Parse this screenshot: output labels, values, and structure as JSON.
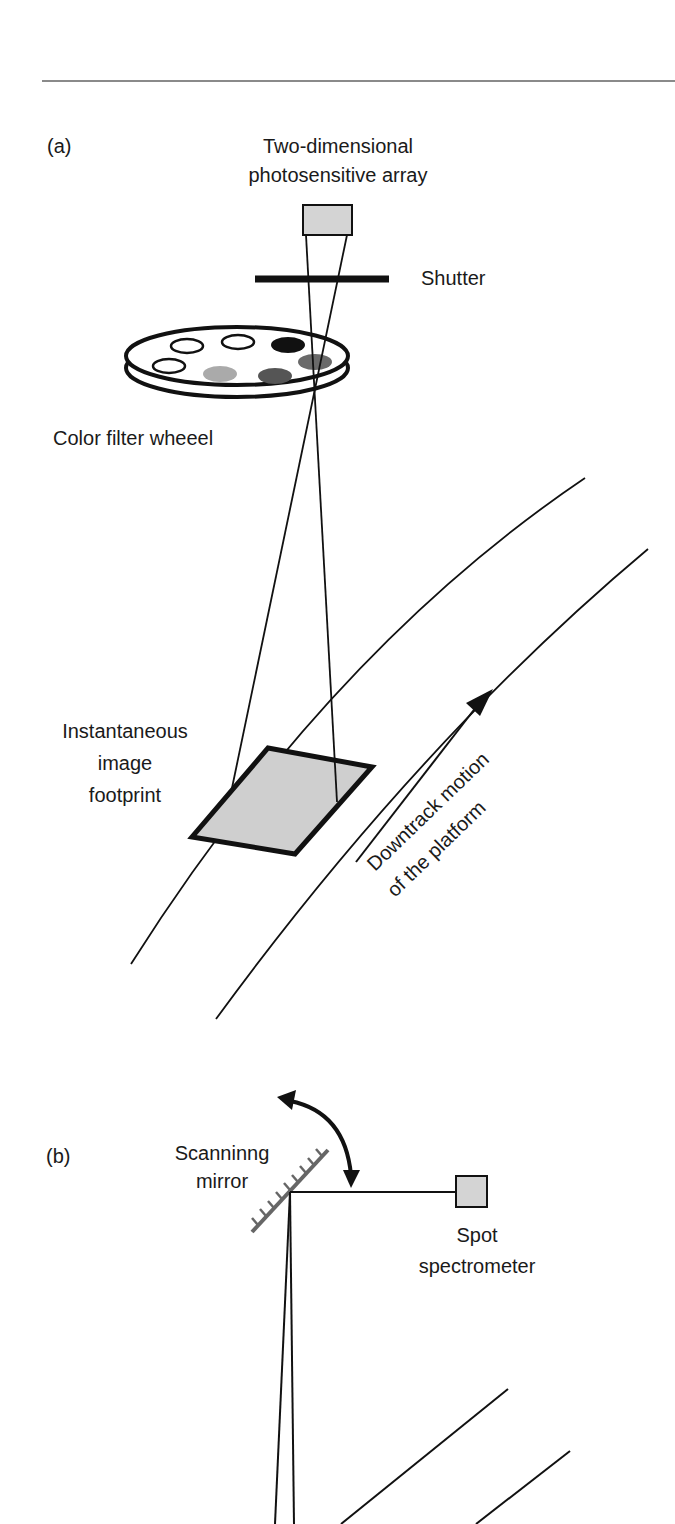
{
  "panel_a": {
    "label": "(a)",
    "array_label_line1": "Two-dimensional",
    "array_label_line2": "photosensitive array",
    "shutter_label": "Shutter",
    "wheel_label": "Color filter wheeel",
    "footprint_label_line1": "Instantaneous",
    "footprint_label_line2": "image",
    "footprint_label_line3": "footprint",
    "motion_label_line1": "Downtrack motion",
    "motion_label_line2": "of the platform"
  },
  "panel_b": {
    "label": "(b)",
    "mirror_label_line1": "Scanninng",
    "mirror_label_line2": "mirror",
    "spectrometer_label_line1": "Spot",
    "spectrometer_label_line2": "spectrometer"
  },
  "colors": {
    "ink": "#111111",
    "sensor_fill": "#d4d4d4",
    "footprint_fill": "#cfcfcf",
    "mirror": "#666666",
    "filter_black": "#111111",
    "filter_dark": "#555555",
    "filter_mid": "#6a6a6a",
    "filter_light": "#aaaaaa",
    "rule": "#888888"
  }
}
